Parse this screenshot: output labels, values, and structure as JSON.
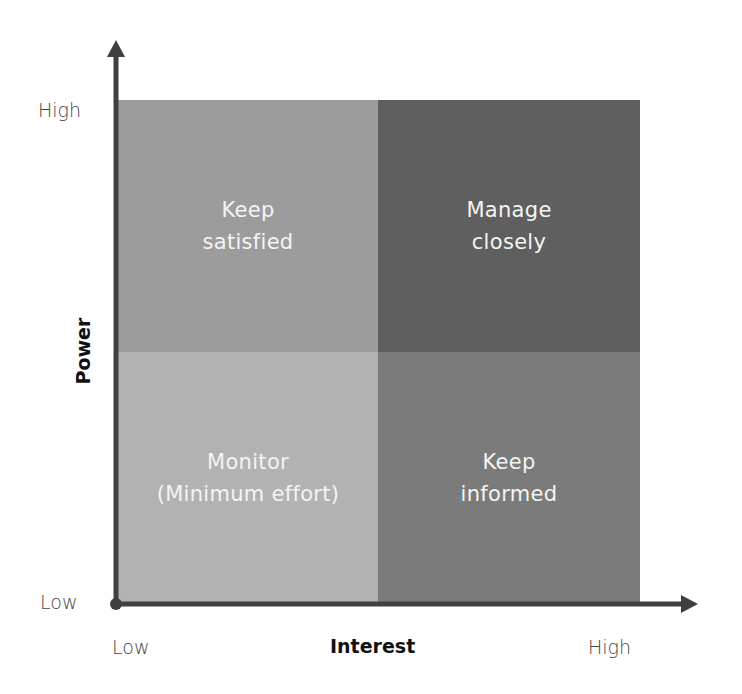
{
  "diagram": {
    "type": "2x2 matrix",
    "x_axis": {
      "title": "Interest",
      "low_label": "Low",
      "high_label": "High"
    },
    "y_axis": {
      "title": "Power",
      "low_label": "Low",
      "high_label": "High"
    },
    "quadrants": [
      {
        "position": "top-left",
        "line1": "Keep",
        "line2": "satisfied",
        "color": "#9c9c9c"
      },
      {
        "position": "top-right",
        "line1": "Manage",
        "line2": "closely",
        "color": "#5f5f5f"
      },
      {
        "position": "bottom-left",
        "line1": "Monitor",
        "line2": "(Minimum effort)",
        "color": "#b2b2b2"
      },
      {
        "position": "bottom-right",
        "line1": "Keep",
        "line2": "informed",
        "color": "#7b7b7b"
      }
    ],
    "axis_color": "#404040"
  }
}
